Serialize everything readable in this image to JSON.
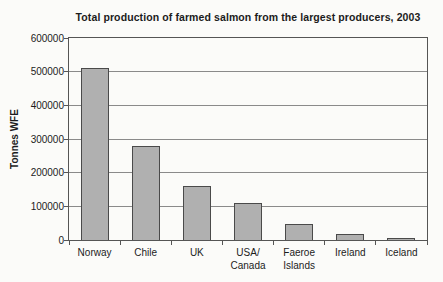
{
  "chart_data": {
    "type": "bar",
    "title": "Total production of farmed salmon from the largest producers, 2003",
    "ylabel": "Tonnes WFE",
    "xlabel": "",
    "categories": [
      "Norway",
      "Chile",
      "UK",
      "USA/\nCanada",
      "Faeroe\nIslands",
      "Ireland",
      "Iceland"
    ],
    "values": [
      510000,
      280000,
      160000,
      110000,
      47000,
      17000,
      5000
    ],
    "ylim": [
      0,
      600000
    ],
    "yticks": [
      0,
      100000,
      200000,
      300000,
      400000,
      500000,
      600000
    ],
    "ytick_labels": [
      "0",
      "100000",
      "200000",
      "300000",
      "400000",
      "500000",
      "600000"
    ],
    "grid": true,
    "legend": false,
    "bar_fill": "#b0b0b0",
    "bar_border": "#4a4a4a",
    "gridline_color": "#8a8a8a",
    "axis_color": "#555555",
    "background": "#fbfbf9",
    "text_color": "#1c1c1c",
    "bar_width_px": 28
  }
}
